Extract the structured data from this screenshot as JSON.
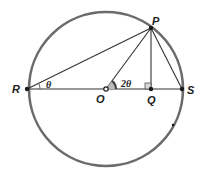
{
  "figure": {
    "type": "geometry",
    "colors": {
      "circle": "#6b6b6b",
      "lines": "#333333",
      "points": "#1a1a1a",
      "angle_fill": "#444444"
    },
    "points": {
      "P": {
        "label": "P"
      },
      "R": {
        "label": "R"
      },
      "O": {
        "label": "O"
      },
      "Q": {
        "label": "Q"
      },
      "S": {
        "label": "S"
      }
    },
    "angles": {
      "PRS": {
        "label": "θ"
      },
      "POS": {
        "label": "2θ"
      }
    },
    "marks": {
      "right_angle": "PQS"
    }
  }
}
